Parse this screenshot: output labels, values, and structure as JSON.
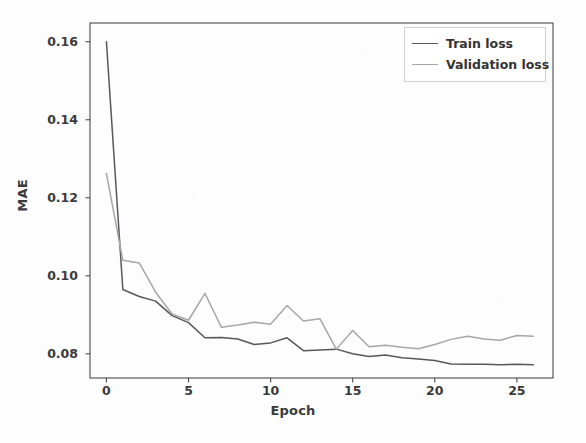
{
  "chart_data": {
    "type": "line",
    "title": "",
    "xlabel": "Epoch",
    "ylabel": "MAE",
    "xlim": [
      -1.0,
      27.2
    ],
    "ylim": [
      0.0738,
      0.1648
    ],
    "xticks": [
      0,
      5,
      10,
      15,
      20,
      25
    ],
    "xticklabels": [
      "0",
      "5",
      "10",
      "15",
      "20",
      "25"
    ],
    "yticks": [
      0.08,
      0.1,
      0.12,
      0.14,
      0.16
    ],
    "yticklabels": [
      "0.08",
      "0.10",
      "0.12",
      "0.14",
      "0.16"
    ],
    "grid": false,
    "legend_position": "upper right",
    "x": [
      0,
      1,
      2,
      3,
      4,
      5,
      6,
      7,
      8,
      9,
      10,
      11,
      12,
      13,
      14,
      15,
      16,
      17,
      18,
      19,
      20,
      21,
      22,
      23,
      24,
      25,
      26
    ],
    "series": [
      {
        "name": "Train loss",
        "color": "#57575c",
        "values": [
          0.16,
          0.0965,
          0.0947,
          0.0935,
          0.0898,
          0.088,
          0.0841,
          0.0842,
          0.0838,
          0.0824,
          0.0828,
          0.0841,
          0.0808,
          0.081,
          0.0812,
          0.08,
          0.0793,
          0.0797,
          0.079,
          0.0787,
          0.0783,
          0.0774,
          0.0773,
          0.0773,
          0.0772,
          0.0773,
          0.0772
        ]
      },
      {
        "name": "Validation loss",
        "color": "#a6a6ab",
        "values": [
          0.1262,
          0.104,
          0.1033,
          0.0958,
          0.0902,
          0.0886,
          0.0955,
          0.0868,
          0.0874,
          0.0881,
          0.0876,
          0.0924,
          0.0884,
          0.089,
          0.0812,
          0.086,
          0.0818,
          0.0822,
          0.0817,
          0.0813,
          0.0824,
          0.0837,
          0.0845,
          0.0838,
          0.0835,
          0.0847,
          0.0845
        ]
      }
    ]
  },
  "legend": {
    "entries": [
      {
        "label": "Train loss"
      },
      {
        "label": "Validation loss"
      }
    ]
  },
  "colors": {
    "train": "#57575c",
    "validation": "#a6a6ab",
    "axis": "#4a4a4a",
    "text": "#3a3a3a",
    "background": "#fdfdfd"
  }
}
